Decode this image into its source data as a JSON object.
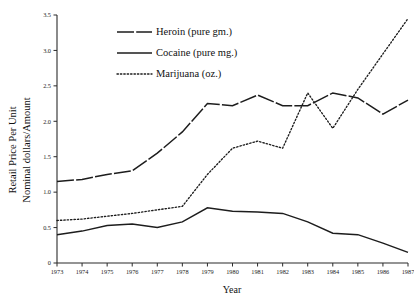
{
  "chart_data": {
    "type": "line",
    "title": "",
    "xlabel": "Year",
    "ylabel_line1": "Retail Price Per Unit",
    "ylabel_line2": "Nominal dollars/Amount",
    "grid": false,
    "legend_position": "top-center",
    "xlim": [
      1973,
      1987
    ],
    "ylim": [
      0,
      3.5
    ],
    "x": [
      1973,
      1974,
      1975,
      1976,
      1977,
      1978,
      1979,
      1980,
      1981,
      1982,
      1983,
      1984,
      1985,
      1986,
      1987
    ],
    "categories": [
      "1973",
      "1974",
      "1975",
      "1976",
      "1977",
      "1978",
      "1979",
      "1980",
      "1981",
      "1982",
      "1983",
      "1984",
      "1985",
      "1986",
      "1987"
    ],
    "ytick_labels": [
      "0",
      "0.5",
      "1.0",
      "1.5",
      "2.0",
      "2.5",
      "3.0",
      "3.5"
    ],
    "ytick_values": [
      0,
      0.5,
      1.0,
      1.5,
      2.0,
      2.5,
      3.0,
      3.5
    ],
    "series": [
      {
        "name": "Heroin (pure gm.)",
        "style": "dashed",
        "values": [
          1.15,
          1.18,
          1.25,
          1.3,
          1.55,
          1.85,
          2.25,
          2.22,
          2.37,
          2.22,
          2.22,
          2.4,
          2.33,
          2.1,
          2.3
        ]
      },
      {
        "name": "Cocaine (pure mg.)",
        "style": "solid",
        "values": [
          0.4,
          0.45,
          0.53,
          0.55,
          0.5,
          0.58,
          0.78,
          0.73,
          0.72,
          0.7,
          0.58,
          0.42,
          0.4,
          0.28,
          0.15
        ]
      },
      {
        "name": "Marijuana (oz.)",
        "style": "dotted",
        "values": [
          0.6,
          0.62,
          0.66,
          0.7,
          0.75,
          0.8,
          1.25,
          1.62,
          1.72,
          1.62,
          2.4,
          1.9,
          2.45,
          2.95,
          3.45
        ]
      }
    ]
  },
  "legend": {
    "items": [
      {
        "label": "Heroin (pure gm.)",
        "style": "dashed"
      },
      {
        "label": "Cocaine (pure mg.)",
        "style": "solid"
      },
      {
        "label": "Marijuana (oz.)",
        "style": "dotted"
      }
    ]
  },
  "axes": {
    "x_title": "Year",
    "y_title_line1": "Retail Price Per Unit",
    "y_title_line2": "Nominal dollars/Amount"
  }
}
